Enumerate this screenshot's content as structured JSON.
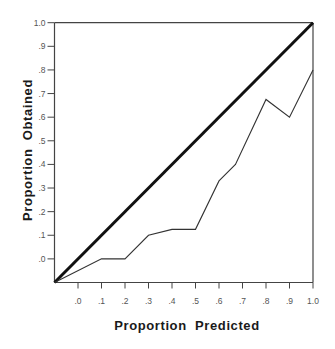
{
  "chart_data": {
    "type": "line",
    "title": "",
    "xlabel": "Proportion  Predicted",
    "ylabel": "Proportion  Obtained",
    "xlim": [
      -0.1,
      1.0
    ],
    "ylim": [
      -0.1,
      1.0
    ],
    "grid": false,
    "legend": null,
    "x_ticks": [
      ".0",
      ".1",
      ".2",
      ".3",
      ".4",
      ".5",
      ".6",
      ".7",
      ".8",
      ".9",
      "1.0"
    ],
    "x_tick_values": [
      0.0,
      0.1,
      0.2,
      0.3,
      0.4,
      0.5,
      0.6,
      0.7,
      0.8,
      0.9,
      1.0
    ],
    "y_ticks": [
      ".0",
      ".1",
      ".2",
      ".3",
      ".4",
      ".5",
      ".6",
      ".7",
      ".8",
      ".9",
      "1.0"
    ],
    "y_tick_values": [
      0.0,
      0.1,
      0.2,
      0.3,
      0.4,
      0.5,
      0.6,
      0.7,
      0.8,
      0.9,
      1.0
    ],
    "series": [
      {
        "name": "Reference (perfect calibration)",
        "style": "thick",
        "color": "#111111",
        "x": [
          -0.1,
          1.0
        ],
        "y": [
          -0.1,
          1.0
        ]
      },
      {
        "name": "Observed",
        "style": "thin",
        "color": "#333333",
        "x": [
          -0.1,
          0.1,
          0.2,
          0.3,
          0.4,
          0.5,
          0.6,
          0.67,
          0.8,
          0.9,
          1.0
        ],
        "y": [
          -0.1,
          0.0,
          0.0,
          0.1,
          0.125,
          0.125,
          0.33,
          0.4,
          0.675,
          0.6,
          0.8
        ]
      }
    ]
  }
}
